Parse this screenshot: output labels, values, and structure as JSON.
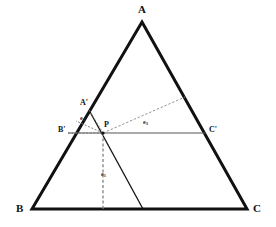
{
  "figure": {
    "background_color": "#ffffff",
    "stroke_color": "#111111",
    "thin_stroke_color": "#555555",
    "dashed_stroke_color": "#777777",
    "outer_stroke_width": 3,
    "inner_stroke_width": 1,
    "vertices": {
      "A": {
        "x": 142,
        "y": 22
      },
      "B": {
        "x": 32,
        "y": 209
      },
      "C": {
        "x": 247,
        "y": 209
      },
      "A_prime": {
        "x": 89,
        "y": 110
      },
      "B_prime": {
        "x": 68,
        "y": 133
      },
      "C_prime": {
        "x": 206,
        "y": 133
      },
      "P": {
        "x": 103,
        "y": 133
      },
      "foot_e1": {
        "x": 103,
        "y": 209
      },
      "foot_e3": {
        "x": 185,
        "y": 97
      },
      "line_foot_bc": {
        "x": 143,
        "y": 209
      }
    },
    "labels": {
      "A": "A",
      "B": "B",
      "C": "C",
      "A_prime": "A'",
      "B_prime": "B'",
      "C_prime": "C'",
      "P": "P",
      "e1": "e",
      "e1_sub": "1",
      "e2": "e",
      "e2_sub": "2",
      "e3": "e",
      "e3_sub": "3"
    },
    "label_positions": {
      "A": {
        "x": 138,
        "y": 4
      },
      "B": {
        "x": 16,
        "y": 203
      },
      "C": {
        "x": 253,
        "y": 203
      },
      "A_prime": {
        "x": 80,
        "y": 99
      },
      "B_prime": {
        "x": 58,
        "y": 126
      },
      "C_prime": {
        "x": 209,
        "y": 126
      },
      "P": {
        "x": 104,
        "y": 121
      },
      "e1": {
        "x": 101,
        "y": 171
      },
      "e2": {
        "x": 80,
        "y": 115
      },
      "e3": {
        "x": 143,
        "y": 119
      }
    }
  }
}
